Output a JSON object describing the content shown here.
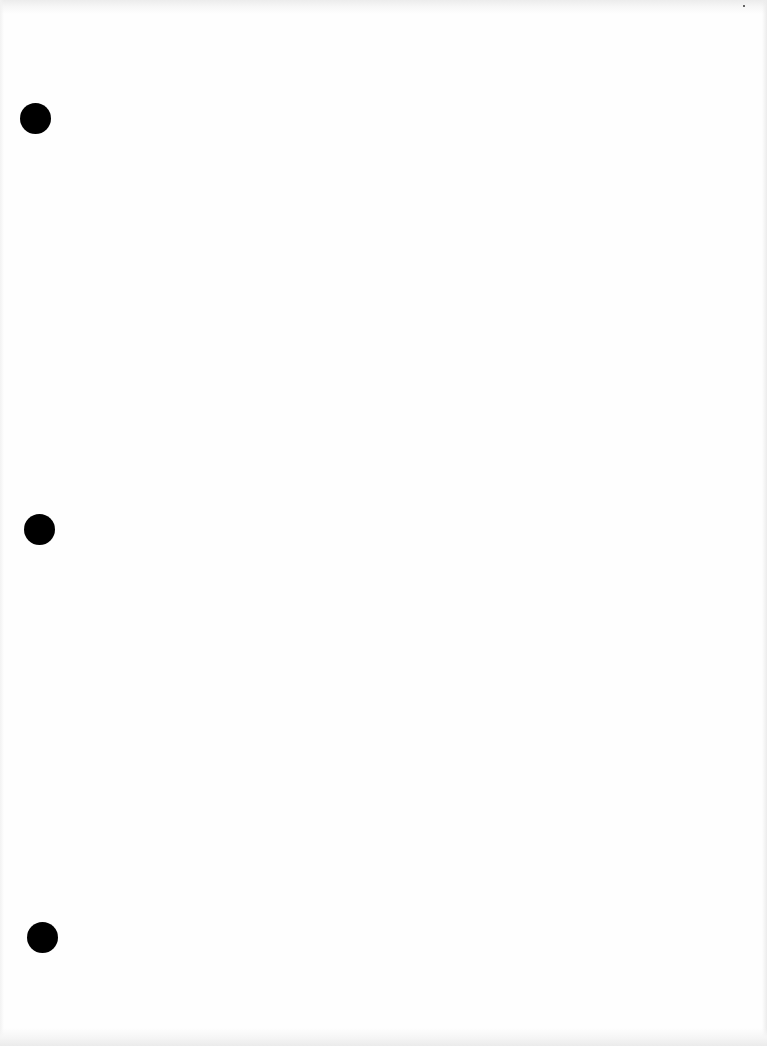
{
  "document": {
    "type": "blank scanned page",
    "text": "",
    "punch_holes": [
      {
        "id": "top",
        "x": 20,
        "y": 103,
        "size": 31
      },
      {
        "id": "middle",
        "x": 24,
        "y": 514,
        "size": 31
      },
      {
        "id": "bottom",
        "x": 27,
        "y": 922,
        "size": 31
      }
    ],
    "colors": {
      "paper": "#fefefe",
      "hole": "#000000"
    }
  }
}
